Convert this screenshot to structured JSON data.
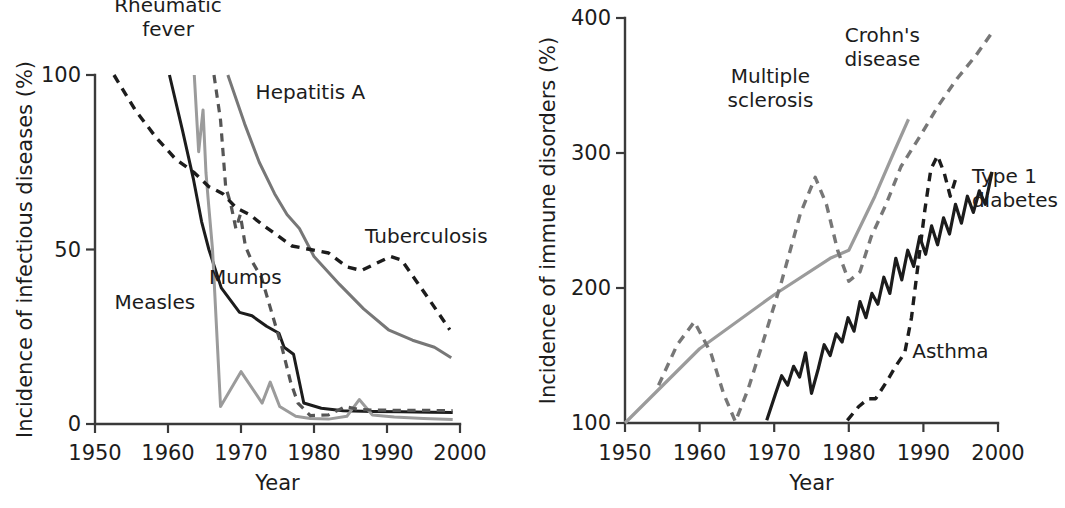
{
  "figure": {
    "background_color": "#ffffff",
    "panels": [
      "infectious-diseases",
      "immune-disorders"
    ]
  },
  "colors": {
    "black": "#1c1c1c",
    "dark_gray": "#555555",
    "mid_gray": "#777777",
    "light_gray": "#9b9b9b",
    "axis": "#3a3a3a"
  },
  "chart_data": [
    {
      "type": "line",
      "id": "infectious-diseases",
      "title": "",
      "xlabel": "Year",
      "ylabel": "Incidence of infectious diseases (%)",
      "xlim": [
        1950,
        2000
      ],
      "ylim": [
        0,
        100
      ],
      "xticks": [
        1950,
        1960,
        1970,
        1980,
        1990,
        2000
      ],
      "xtick_labels": [
        "1950",
        "1960",
        "1970",
        "1980",
        "1990",
        "2000"
      ],
      "yticks": [
        0,
        50,
        100
      ],
      "ytick_labels": [
        "0",
        "50",
        "100"
      ],
      "grid": false,
      "legend": "inline-annotations",
      "series": [
        {
          "name": "Rheumatic fever",
          "style": "solid",
          "color": "#1c1c1c",
          "width": 3.0,
          "label_x": 1960.0,
          "label_y": 118,
          "label_anchor": "middle",
          "points": [
            [
              1960.2,
              100
            ],
            [
              1962,
              84
            ],
            [
              1963.5,
              70
            ],
            [
              1964.6,
              58
            ],
            [
              1965.6,
              50
            ],
            [
              1967.3,
              39
            ],
            [
              1969.8,
              32
            ],
            [
              1971.5,
              31
            ],
            [
              1973.5,
              28
            ],
            [
              1975.2,
              26
            ],
            [
              1975.9,
              22
            ],
            [
              1977.2,
              20
            ],
            [
              1978.6,
              6
            ],
            [
              1981,
              4.5
            ],
            [
              1984,
              3.8
            ],
            [
              1988,
              3.6
            ],
            [
              1992,
              3.5
            ],
            [
              1996,
              3.4
            ],
            [
              1999,
              3.3
            ]
          ]
        },
        {
          "name": "Measles",
          "style": "solid",
          "color": "#9b9b9b",
          "width": 3.0,
          "label_x": 1958.2,
          "label_y": 33,
          "label_anchor": "middle",
          "points": [
            [
              1963.6,
              100
            ],
            [
              1964.2,
              78
            ],
            [
              1964.8,
              90
            ],
            [
              1965.2,
              72
            ],
            [
              1965.6,
              62
            ],
            [
              1966.1,
              50
            ],
            [
              1967.2,
              5
            ],
            [
              1970.0,
              15
            ],
            [
              1972.9,
              6
            ],
            [
              1974.0,
              12
            ],
            [
              1975.3,
              5
            ],
            [
              1977.5,
              2.2
            ],
            [
              1979.5,
              1.6
            ],
            [
              1982,
              1.4
            ],
            [
              1984.5,
              2.2
            ],
            [
              1986.2,
              7
            ],
            [
              1988,
              2.6
            ],
            [
              1991,
              2.0
            ],
            [
              1995,
              1.6
            ],
            [
              1999,
              1.3
            ]
          ]
        },
        {
          "name": "Mumps",
          "style": "dashed",
          "color": "#555555",
          "width": 3.2,
          "label_x": 1970.6,
          "label_y": 40,
          "label_anchor": "middle",
          "points": [
            [
              1966.3,
              100
            ],
            [
              1967.2,
              87
            ],
            [
              1967.9,
              68
            ],
            [
              1968.6,
              63
            ],
            [
              1969.3,
              56
            ],
            [
              1969.9,
              60
            ],
            [
              1970.6,
              51
            ],
            [
              1971.4,
              47
            ],
            [
              1972.8,
              42
            ],
            [
              1974.2,
              32
            ],
            [
              1975.6,
              22
            ],
            [
              1976.8,
              12
            ],
            [
              1977.8,
              6
            ],
            [
              1979.5,
              2.4
            ],
            [
              1982,
              2.6
            ],
            [
              1984.3,
              5
            ],
            [
              1986,
              4.2
            ],
            [
              1988,
              4.0
            ],
            [
              1992,
              3.9
            ],
            [
              1996,
              3.9
            ],
            [
              1999,
              3.8
            ]
          ]
        },
        {
          "name": "Hepatitis A",
          "style": "solid",
          "color": "#777777",
          "width": 3.0,
          "label_x": 1972.0,
          "label_y": 93,
          "label_anchor": "start",
          "points": [
            [
              1968.2,
              100
            ],
            [
              1970.5,
              86
            ],
            [
              1972.5,
              75
            ],
            [
              1974.6,
              66
            ],
            [
              1976.3,
              60
            ],
            [
              1978.0,
              56
            ],
            [
              1980.0,
              48
            ],
            [
              1983.5,
              40
            ],
            [
              1986.8,
              33
            ],
            [
              1990.2,
              27
            ],
            [
              1993.5,
              24
            ],
            [
              1996.5,
              22
            ],
            [
              1998.8,
              19
            ]
          ]
        },
        {
          "name": "Tuberculosis",
          "style": "dashed",
          "color": "#1c1c1c",
          "width": 3.4,
          "label_x": 1987.0,
          "label_y": 52,
          "label_anchor": "start",
          "points": [
            [
              1952.6,
              100
            ],
            [
              1955.5,
              90
            ],
            [
              1958.4,
              82
            ],
            [
              1961.0,
              76
            ],
            [
              1963.6,
              72
            ],
            [
              1965.6,
              68
            ],
            [
              1967.5,
              66
            ],
            [
              1969.3,
              62
            ],
            [
              1971.2,
              60
            ],
            [
              1973.0,
              57
            ],
            [
              1975.0,
              54
            ],
            [
              1977.0,
              51
            ],
            [
              1979.5,
              50
            ],
            [
              1982.0,
              49
            ],
            [
              1984.5,
              45
            ],
            [
              1986.5,
              44
            ],
            [
              1988.5,
              46
            ],
            [
              1990.5,
              48
            ],
            [
              1992.0,
              47
            ],
            [
              1994.0,
              41
            ],
            [
              1996.0,
              35
            ],
            [
              1998.6,
              27
            ]
          ]
        }
      ]
    },
    {
      "type": "line",
      "id": "immune-disorders",
      "title": "",
      "xlabel": "Year",
      "ylabel": "Incidence of immune disorders (%)",
      "xlim": [
        1950,
        2000
      ],
      "ylim": [
        100,
        400
      ],
      "xticks": [
        1950,
        1960,
        1970,
        1980,
        1990,
        2000
      ],
      "xtick_labels": [
        "1950",
        "1960",
        "1970",
        "1980",
        "1990",
        "2000"
      ],
      "yticks": [
        100,
        200,
        300,
        400
      ],
      "ytick_labels": [
        "100",
        "200",
        "300",
        "400"
      ],
      "grid": false,
      "legend": "inline-annotations",
      "series": [
        {
          "name": "Multiple sclerosis",
          "style": "solid",
          "color": "#9b9b9b",
          "width": 3.2,
          "label_x": 1969.5,
          "label_y": 352,
          "label_anchor": "middle",
          "points": [
            [
              1950,
              100
            ],
            [
              1960,
              155
            ],
            [
              1970,
              195
            ],
            [
              1977.5,
              222
            ],
            [
              1980.0,
              228
            ],
            [
              1983.5,
              268
            ],
            [
              1986.0,
              300
            ],
            [
              1988.0,
              325
            ]
          ]
        },
        {
          "name": "Crohn's disease",
          "style": "dashed",
          "color": "#777777",
          "width": 3.4,
          "label_x": 1984.5,
          "label_y": 382,
          "label_anchor": "middle",
          "points": [
            [
              1954.5,
              128
            ],
            [
              1957.0,
              158
            ],
            [
              1959.3,
              175
            ],
            [
              1961.5,
              152
            ],
            [
              1963.2,
              122
            ],
            [
              1964.8,
              101
            ],
            [
              1966.5,
              125
            ],
            [
              1968.5,
              160
            ],
            [
              1971.0,
              205
            ],
            [
              1973.5,
              255
            ],
            [
              1975.5,
              282
            ],
            [
              1977.0,
              262
            ],
            [
              1978.5,
              228
            ],
            [
              1980.0,
              205
            ],
            [
              1981.5,
              212
            ],
            [
              1983.0,
              238
            ],
            [
              1985.0,
              262
            ],
            [
              1987.0,
              290
            ],
            [
              1989.5,
              312
            ],
            [
              1992.0,
              335
            ],
            [
              1994.5,
              355
            ],
            [
              1997.0,
              372
            ],
            [
              1999.3,
              390
            ]
          ]
        },
        {
          "name": "Asthma",
          "style": "dashed",
          "color": "#1c1c1c",
          "width": 3.4,
          "label_x": 1988.5,
          "label_y": 148,
          "label_anchor": "start",
          "points": [
            [
              1979.8,
              102
            ],
            [
              1981.3,
              112
            ],
            [
              1982.6,
              118
            ],
            [
              1983.6,
              118
            ],
            [
              1985.0,
              130
            ],
            [
              1986.4,
              143
            ],
            [
              1987.5,
              152
            ],
            [
              1988.4,
              178
            ],
            [
              1989.3,
              218
            ],
            [
              1990.2,
              258
            ],
            [
              1991.0,
              288
            ],
            [
              1991.9,
              298
            ],
            [
              1992.8,
              285
            ],
            [
              1993.6,
              268
            ],
            [
              1994.4,
              282
            ]
          ]
        },
        {
          "name": "Type 1 diabetes",
          "style": "solid",
          "color": "#1c1c1c",
          "width": 3.2,
          "label_x": 1996.5,
          "label_y": 278,
          "label_anchor": "start",
          "points": [
            [
              1969.0,
              102
            ],
            [
              1970.2,
              122
            ],
            [
              1971.0,
              135
            ],
            [
              1971.8,
              128
            ],
            [
              1972.6,
              142
            ],
            [
              1973.4,
              134
            ],
            [
              1974.2,
              152
            ],
            [
              1975.0,
              122
            ],
            [
              1975.9,
              140
            ],
            [
              1976.7,
              158
            ],
            [
              1977.5,
              150
            ],
            [
              1978.3,
              166
            ],
            [
              1979.1,
              160
            ],
            [
              1979.9,
              178
            ],
            [
              1980.7,
              168
            ],
            [
              1981.5,
              190
            ],
            [
              1982.3,
              178
            ],
            [
              1983.1,
              196
            ],
            [
              1983.9,
              188
            ],
            [
              1984.7,
              208
            ],
            [
              1985.5,
              196
            ],
            [
              1986.3,
              222
            ],
            [
              1987.1,
              206
            ],
            [
              1987.9,
              228
            ],
            [
              1988.7,
              216
            ],
            [
              1989.5,
              238
            ],
            [
              1990.3,
              225
            ],
            [
              1991.1,
              246
            ],
            [
              1991.9,
              232
            ],
            [
              1992.7,
              252
            ],
            [
              1993.5,
              240
            ],
            [
              1994.3,
              262
            ],
            [
              1995.1,
              248
            ],
            [
              1995.9,
              268
            ],
            [
              1996.7,
              256
            ],
            [
              1997.5,
              272
            ],
            [
              1998.3,
              262
            ],
            [
              1999.2,
              286
            ]
          ]
        }
      ]
    }
  ]
}
